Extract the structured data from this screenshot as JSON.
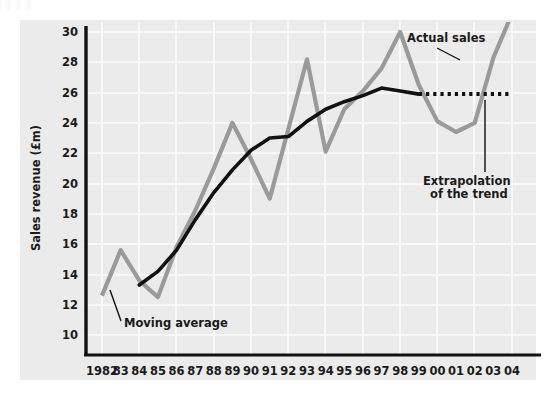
{
  "figure": {
    "background_color": "#ffffff",
    "plot_background_color": "#ebebeb",
    "gridline_color": "#f7f7f7",
    "axis_color": "#1a1a1a"
  },
  "chart_data": {
    "type": "line",
    "title": "",
    "xlabel": "",
    "ylabel": "Sales revenue (£m)",
    "ylim": [
      10,
      30
    ],
    "yticks": [
      10,
      12,
      14,
      16,
      18,
      20,
      22,
      24,
      26,
      28,
      30
    ],
    "grid": true,
    "legend_position": "none",
    "categories": [
      "1982",
      "83",
      "84",
      "85",
      "86",
      "87",
      "88",
      "89",
      "90",
      "91",
      "92",
      "93",
      "94",
      "95",
      "96",
      "97",
      "98",
      "99",
      "00",
      "01",
      "02",
      "03",
      "04"
    ],
    "series": [
      {
        "name": "Actual sales",
        "color": "#9a9a9a",
        "style": "solid",
        "x": [
          "1982",
          "83",
          "84",
          "85",
          "86",
          "87",
          "88",
          "89",
          "90",
          "91",
          "92",
          "93",
          "94",
          "95",
          "96",
          "97",
          "98",
          "99",
          "00",
          "01",
          "02",
          "03",
          "04"
        ],
        "values": [
          12.6,
          15.6,
          13.6,
          12.5,
          15.8,
          18.2,
          21.0,
          24.0,
          21.6,
          19.0,
          23.6,
          28.2,
          22.1,
          24.9,
          26.1,
          27.6,
          30.0,
          26.5,
          24.1,
          23.4,
          24.0,
          28.3,
          31.2
        ]
      },
      {
        "name": "Moving average",
        "color": "#111111",
        "style": "solid",
        "x": [
          "84",
          "85",
          "86",
          "87",
          "88",
          "89",
          "90",
          "91",
          "92",
          "93",
          "94",
          "95",
          "96",
          "97",
          "98",
          "99"
        ],
        "values": [
          13.3,
          14.2,
          15.6,
          17.6,
          19.4,
          20.9,
          22.2,
          23.0,
          23.1,
          24.1,
          24.9,
          25.4,
          25.8,
          26.3,
          26.1,
          25.9
        ]
      },
      {
        "name": "Extrapolation of the trend",
        "color": "#111111",
        "style": "dotted",
        "x": [
          "99",
          "04"
        ],
        "values": [
          25.9,
          25.9
        ]
      }
    ],
    "annotations": [
      {
        "id": "actual-sales",
        "text": "Actual sales",
        "target_series": "Actual sales"
      },
      {
        "id": "moving-average",
        "text": "Moving average",
        "target_series": "Moving average"
      },
      {
        "id": "extrapolation",
        "text_line1": "Extrapolation",
        "text_line2": "of the trend",
        "target_series": "Extrapolation of the trend"
      }
    ]
  }
}
